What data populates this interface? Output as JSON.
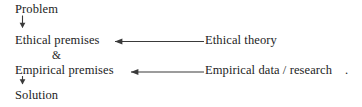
{
  "diagram": {
    "title": "",
    "background_color": "#ffffff",
    "line_color": "#3a3a3a",
    "text_color": "#1d1d1d",
    "nodes": {
      "problem": "Problem",
      "ethical_premises": "Ethical premises",
      "ampersand": "&",
      "empirical_premises": "Empirical premises",
      "solution": "Solution",
      "ethical_theory": "Ethical theory",
      "empirical_data": "Empirical data / research",
      "trailing_period": "."
    },
    "connectors": [
      {
        "name": "problem-to-ethical-premises",
        "from": "problem",
        "to": "ethical_premises",
        "direction": "down",
        "arrowhead": "end"
      },
      {
        "name": "ethical-theory-to-ethical-premises",
        "from": "ethical_theory",
        "to": "ethical_premises",
        "direction": "left",
        "arrowhead": "end"
      },
      {
        "name": "empirical-data-to-empirical-premises",
        "from": "empirical_data",
        "to": "empirical_premises",
        "direction": "left",
        "arrowhead": "end"
      },
      {
        "name": "empirical-premises-to-solution",
        "from": "empirical_premises",
        "to": "solution",
        "direction": "down",
        "arrowhead": "end"
      }
    ]
  }
}
